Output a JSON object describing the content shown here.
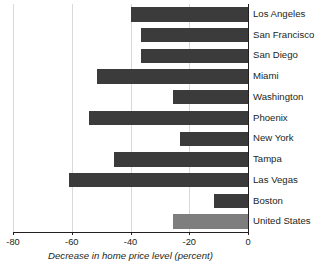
{
  "chart_data": {
    "type": "bar",
    "orientation": "horizontal",
    "title": "",
    "xlabel": "Decrease in home price level (percent)",
    "ylabel": "",
    "xlim": [
      -80,
      0
    ],
    "xticks": [
      -80,
      -60,
      -40,
      -20,
      0
    ],
    "xtick_labels": [
      "-80",
      "-60",
      "-40",
      "-20",
      "0"
    ],
    "grid": "vertical",
    "legend": "none",
    "categories": [
      "Los Angeles",
      "San Francisco",
      "San Diego",
      "Miami",
      "Washington",
      "Phoenix",
      "New York",
      "Tampa",
      "Las Vegas",
      "Boston",
      "United States"
    ],
    "values": [
      -40,
      -36.5,
      -36.5,
      -51.5,
      -25.5,
      -54,
      -23,
      -45.5,
      -61,
      -11.5,
      -25.5
    ],
    "bar_colors": [
      "#3b3b3b",
      "#3b3b3b",
      "#3b3b3b",
      "#3b3b3b",
      "#3b3b3b",
      "#3b3b3b",
      "#3b3b3b",
      "#3b3b3b",
      "#3b3b3b",
      "#3b3b3b",
      "#7e7e7e"
    ],
    "highlight_category": "United States",
    "highlight_color": "#7e7e7e",
    "bar_color": "#3b3b3b",
    "gridline_color": "#d9d9d9",
    "axis_color": "#231f20",
    "background": "#ffffff"
  }
}
